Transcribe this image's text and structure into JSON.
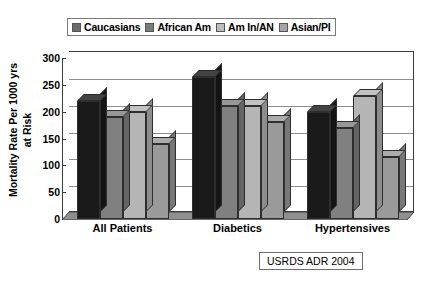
{
  "chart_data": {
    "type": "bar",
    "title": "",
    "subtitle": "",
    "xlabel": "",
    "ylabel": "Mortality Rate Per 1000 yrs at Risk",
    "ylabel_lines": [
      "Mortality Rate Per 1000 yrs",
      "at Risk"
    ],
    "categories": [
      "All Patients",
      "Diabetics",
      "Hypertensives"
    ],
    "series": [
      {
        "name": "Caucasians",
        "values": [
          220,
          265,
          200
        ],
        "color": "#1a1a1a"
      },
      {
        "name": "African Am",
        "values": [
          190,
          210,
          170
        ],
        "color": "#808080"
      },
      {
        "name": "Am In/AN",
        "values": [
          200,
          210,
          230
        ],
        "color": "#b5b5b5"
      },
      {
        "name": "Asian/PI",
        "values": [
          140,
          180,
          115
        ],
        "color": "#9a9a9a"
      }
    ],
    "ylim": [
      0,
      300
    ],
    "ytick_labels": [
      "300",
      "250",
      "200",
      "150",
      "100",
      "50",
      "0"
    ],
    "ytick_values": [
      300,
      250,
      200,
      150,
      100,
      50,
      0
    ],
    "ytick_step": 50,
    "grid": true,
    "legend_position": "top",
    "style": "3d-column"
  },
  "legend": {
    "entries": [
      {
        "label": "Caucasians",
        "swatch_color": "#6b6b6b"
      },
      {
        "label": "African Am",
        "swatch_color": "#7a7a7a"
      },
      {
        "label": "Am In/AN",
        "swatch_color": "#bdbdbd"
      },
      {
        "label": "Asian/PI",
        "swatch_color": "#a6a6a6"
      }
    ]
  },
  "source": {
    "text": "USRDS ADR 2004"
  }
}
